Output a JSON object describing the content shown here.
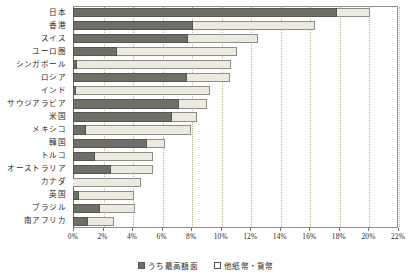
{
  "chart_data": {
    "type": "bar",
    "orientation": "horizontal",
    "stacked": true,
    "title": "",
    "xlabel": "",
    "ylabel": "",
    "xlim": [
      0,
      22
    ],
    "xunit": "%",
    "grid": true,
    "legend_position": "bottom",
    "xticks": [
      0,
      2,
      4,
      6,
      8,
      10,
      12,
      14,
      16,
      18,
      20,
      22
    ],
    "xtick_labels": [
      "0%",
      "2%",
      "4%",
      "6%",
      "8%",
      "10%",
      "12%",
      "14%",
      "16%",
      "18%",
      "20%",
      "22%"
    ],
    "categories": [
      "日本",
      "香港",
      "スイス",
      "ユーロ圏",
      "シンガポール",
      "ロシア",
      "インド",
      "サウジアラビア",
      "米国",
      "メキシコ",
      "韓国",
      "トルコ",
      "オーストラリア",
      "カナダ",
      "英国",
      "ブラジル",
      "南アフリカ"
    ],
    "series": [
      {
        "name": "うち最高額面",
        "color": "#6f6f67",
        "values": [
          17.9,
          8.1,
          7.8,
          3.0,
          0.3,
          7.7,
          0.2,
          7.2,
          6.7,
          0.9,
          5.0,
          1.5,
          2.6,
          0.0,
          0.4,
          1.8,
          1.0
        ]
      },
      {
        "name": "他紙幣・貨幣",
        "color": "#eceade",
        "values": [
          2.2,
          8.3,
          4.7,
          8.1,
          10.4,
          2.9,
          9.1,
          1.9,
          1.7,
          7.1,
          1.2,
          3.9,
          2.8,
          4.6,
          3.7,
          2.4,
          1.8
        ]
      }
    ],
    "totals": [
      20.1,
      16.4,
      12.5,
      11.1,
      10.7,
      10.6,
      9.3,
      9.1,
      8.4,
      8.0,
      6.2,
      5.4,
      5.4,
      4.6,
      4.1,
      4.2,
      2.8
    ]
  },
  "legend": {
    "items": [
      {
        "label": "うち最高額面",
        "swatch": "filled-dark-square"
      },
      {
        "label": "他紙幣・貨幣",
        "swatch": "open-square"
      }
    ]
  }
}
